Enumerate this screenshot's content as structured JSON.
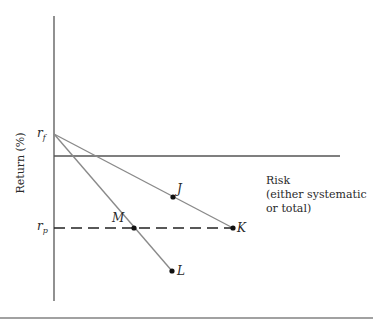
{
  "diagram": {
    "y_axis_label": "Return (%)",
    "x_axis_label_lines": [
      "Risk",
      "(either systematic",
      "or total)"
    ],
    "rf_label_main": "r",
    "rf_label_sub": "f",
    "rp_label_main": "r",
    "rp_label_sub": "p",
    "points": [
      {
        "id": "J",
        "label": "J"
      },
      {
        "id": "K",
        "label": "K"
      },
      {
        "id": "M",
        "label": "M"
      },
      {
        "id": "L",
        "label": "L"
      }
    ],
    "colors": {
      "axis": "#444444",
      "line": "#8a8a8a",
      "dashed": "#222222",
      "point": "#111111"
    }
  }
}
